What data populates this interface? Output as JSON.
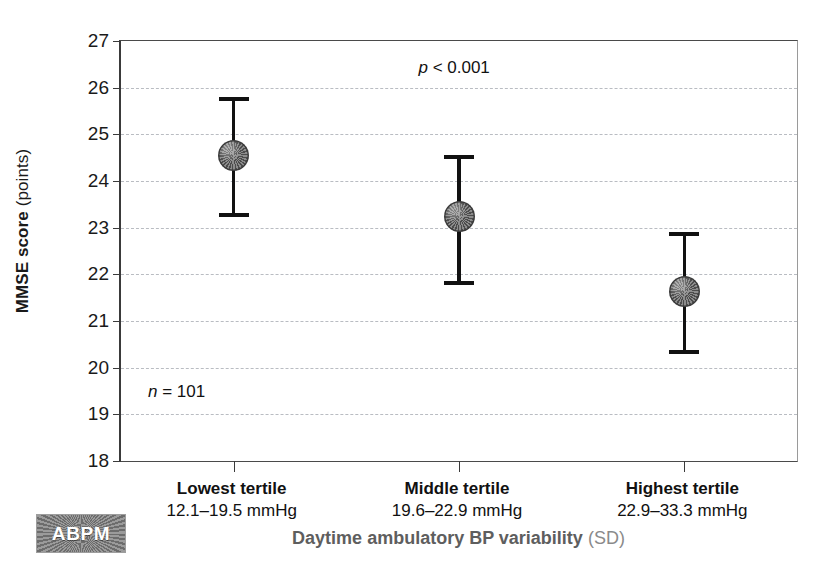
{
  "chart_data": {
    "type": "scatter",
    "title": "",
    "xlabel": "Daytime ambulatory BP variability (SD)",
    "xlabel_main": "Daytime ambulatory BP variability",
    "xlabel_unit": "(SD)",
    "ylabel": "MMSE score (points)",
    "ylabel_main": "MMSE score",
    "ylabel_unit": "(points)",
    "ylim": [
      18,
      27
    ],
    "yticks": [
      27,
      26,
      25,
      24,
      23,
      22,
      21,
      20,
      19,
      18
    ],
    "ytick_labels": [
      "27",
      "26",
      "25",
      "24",
      "23",
      "22",
      "21",
      "20",
      "19",
      "18"
    ],
    "grid": true,
    "grid_style": "dashed",
    "legend": "none",
    "categories": [
      "Lowest tertile",
      "Middle tertile",
      "Highest tertile"
    ],
    "category_ranges": [
      "12.1–19.5 mmHg",
      "19.6–22.9 mmHg",
      "22.9–33.3 mmHg"
    ],
    "values": [
      24.55,
      23.23,
      21.63
    ],
    "error_high": [
      25.8,
      24.55,
      22.9
    ],
    "error_low": [
      23.23,
      21.78,
      20.3
    ],
    "annotations": [
      {
        "name": "p-value",
        "text": "p < 0.001",
        "italic_part": "p",
        "rest": "< 0.001",
        "x_frac": 0.44,
        "y_value": 26.4
      },
      {
        "name": "sample-size",
        "text": "n = 101",
        "italic_part": "n",
        "rest": "= 101",
        "x_frac": 0.04,
        "y_value": 19.45
      }
    ],
    "marker_color": "#6e6e6e",
    "errorbar_color": "#111111",
    "grid_color": "#b9bcc2",
    "axis_color": "#3a3a3a"
  },
  "badge": {
    "label": "ABPM"
  }
}
